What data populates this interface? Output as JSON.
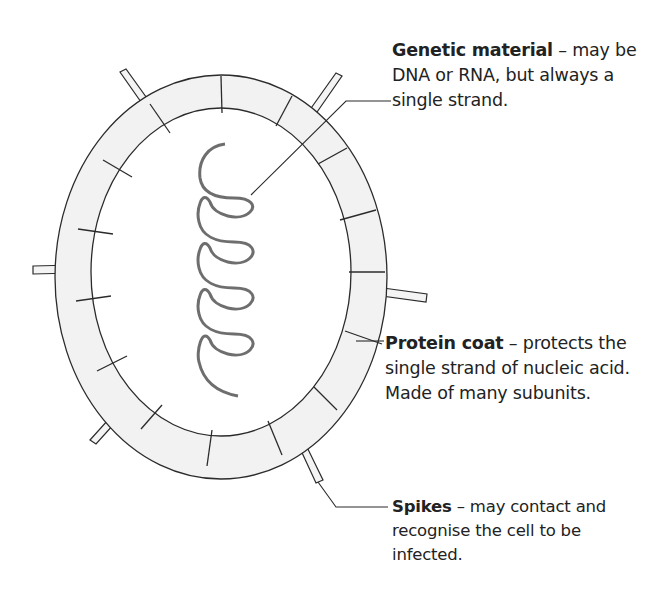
{
  "diagram": {
    "colors": {
      "outline": "#2b2b2b",
      "coat_fill": "#f2f2f2",
      "nucleic_acid": "#6e6e6e",
      "background": "#ffffff"
    },
    "labels": [
      {
        "id": "genetic-material",
        "title": "Genetic material",
        "separator": " – ",
        "lines": [
          "may be",
          "DNA or RNA, but always a",
          "single strand."
        ]
      },
      {
        "id": "protein-coat",
        "title": "Protein coat",
        "separator": " – ",
        "lines": [
          "protects the",
          "single strand of nucleic acid.",
          "Made of many subunits."
        ]
      },
      {
        "id": "spikes",
        "title": "Spikes",
        "separator": " – ",
        "lines": [
          "may contact and",
          "recognise the cell to be",
          "infected."
        ]
      }
    ],
    "parts": {
      "protein_coat_subunits": 16,
      "spike_count": 6,
      "helix_turns": 5
    }
  }
}
